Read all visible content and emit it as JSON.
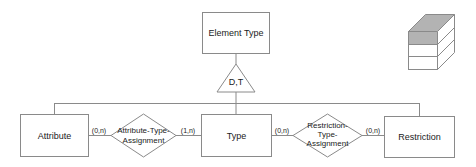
{
  "diagram": {
    "entities": {
      "element_type": "Element Type",
      "attribute": "Attribute",
      "type": "Type",
      "restriction": "Restriction"
    },
    "generalization": {
      "label": "D,T"
    },
    "relationships": {
      "attribute_type_assignment": [
        "Attribute-Type-",
        "Assignment"
      ],
      "restriction_type_assignment": [
        "Restriction-",
        "Type-",
        "Assignment"
      ]
    },
    "cardinalities": {
      "attribute_to_ata": "(0,n)",
      "ata_to_type": "(1,n)",
      "type_to_rta": "(0,n)",
      "rta_to_restriction": "(0,n)"
    },
    "icons": {
      "stack_cube": "database-cube-icon"
    },
    "colors": {
      "stroke": "#8a8a8a",
      "cube_top": "#b3b3b3",
      "text": "#222222"
    }
  }
}
